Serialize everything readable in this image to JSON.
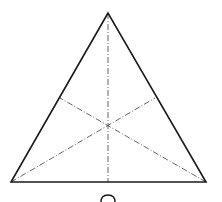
{
  "diagram": {
    "type": "equilateral-triangle-with-medians",
    "stroke_color": "#1a1a1a",
    "median_color": "#666666",
    "vertices": {
      "apex": [
        108,
        13
      ],
      "bottom_left": [
        11,
        182
      ],
      "bottom_right": [
        206,
        182
      ]
    },
    "centroid": [
      108,
      125
    ],
    "median_endpoints": {
      "from_apex": [
        108,
        182
      ],
      "from_bottom_left": [
        155,
        98
      ],
      "from_bottom_right": [
        60,
        98
      ]
    },
    "median_style": "dash-dot",
    "bottom_glyph": "partial arc (cropped label)"
  }
}
